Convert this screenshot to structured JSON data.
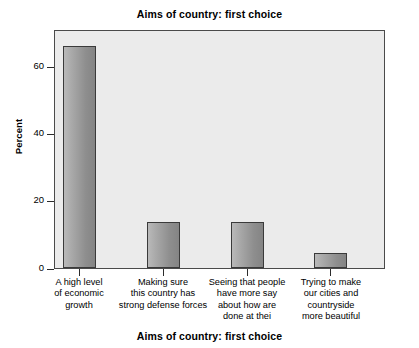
{
  "chart_data": {
    "type": "bar",
    "title": "Aims of country: first choice",
    "xlabel": "Aims of country: first choice",
    "ylabel": "Percent",
    "ylim": [
      0,
      72
    ],
    "yticks": [
      0,
      20,
      40,
      60
    ],
    "ytick_labels": [
      "0",
      "20",
      "40",
      "60"
    ],
    "grid": false,
    "legend": null,
    "categories": [
      "A high level\nof economic\ngrowth",
      "Making sure\nthis country has\nstrong defense forces",
      "Seeing that people\nhave more say\nabout how are\ndone at thei",
      "Trying to make\nour cities and\ncountryside\nmore beautiful"
    ],
    "values": [
      67,
      14,
      14,
      4.5
    ],
    "bar_fill": "#9a9a9a",
    "bar_edge": "#3a3a3a",
    "plot_background": "#ebebeb",
    "figure_background": "#ffffff"
  }
}
